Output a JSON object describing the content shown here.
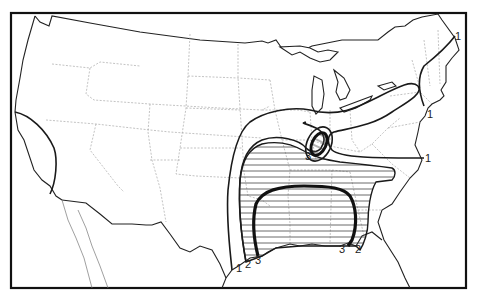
{
  "map": {
    "type": "isoline map",
    "region": "Contiguous United States",
    "style": "black-and-white line map with hatched zones",
    "colors": {
      "ink": "#1a1a1a",
      "state_borders": "#9a9a9a",
      "background": "#ffffff",
      "hatch": "#444444"
    },
    "isolines": [
      {
        "level": "1",
        "description": "outermost contour: from Texas Gulf coast north through Midwest, loop over Ohio Valley, and a separate line along New England coast"
      },
      {
        "level": "2",
        "description": "middle contour enclosing hatched region over Southeast / Mississippi Valley"
      },
      {
        "level": "3",
        "description": "innermost heavy contour over Gulf states plus small hatched oval over Indiana/Ohio"
      }
    ],
    "labels": [
      {
        "text": "1",
        "x": 238,
        "y": 268
      },
      {
        "text": "2",
        "x": 247,
        "y": 264
      },
      {
        "text": "3",
        "x": 257,
        "y": 262
      },
      {
        "text": "3",
        "x": 341,
        "y": 249
      },
      {
        "text": "2",
        "x": 357,
        "y": 250
      },
      {
        "text": "3",
        "x": 307,
        "y": 157
      },
      {
        "text": "1",
        "x": 427,
        "y": 160
      },
      {
        "text": "1",
        "x": 428,
        "y": 115
      },
      {
        "text": "1",
        "x": 456,
        "y": 37
      }
    ]
  }
}
